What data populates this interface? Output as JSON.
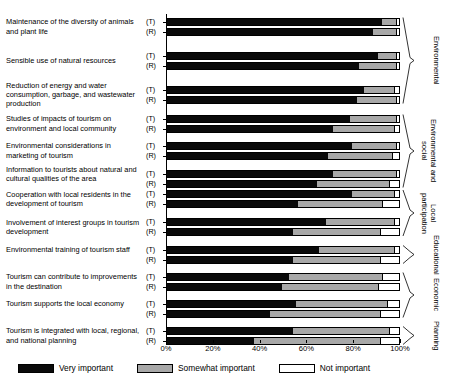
{
  "chart_data": {
    "type": "bar",
    "subtype": "stacked-horizontal-100pct",
    "title": "",
    "xlabel": "",
    "ylabel": "",
    "xlim": [
      0,
      100
    ],
    "xticks": [
      "0%",
      "20%",
      "40%",
      "60%",
      "80%",
      "100%"
    ],
    "xtick_values": [
      0,
      20,
      40,
      60,
      80,
      100
    ],
    "grid": false,
    "legend_position": "bottom-left",
    "series": [
      {
        "name": "Very important",
        "color": "#0a0a0a"
      },
      {
        "name": "Somewhat important",
        "color": "#a8a8a8"
      },
      {
        "name": "Not important",
        "color": "#ffffff"
      }
    ],
    "subgroup_labels": [
      "(T)",
      "(R)"
    ],
    "categories": [
      {
        "label": "Maintenance of the diversity of animals and plant life",
        "rows": [
          {
            "key": "(T)",
            "values": [
              92,
              6,
              2
            ]
          },
          {
            "key": "(R)",
            "values": [
              88,
              10,
              2
            ]
          }
        ]
      },
      {
        "label": "Sensible use of natural resources",
        "rows": [
          {
            "key": "(T)",
            "values": [
              90,
              8,
              2
            ]
          },
          {
            "key": "(R)",
            "values": [
              82,
              16,
              2
            ]
          }
        ]
      },
      {
        "label": "Reduction of energy and water consumption, garbage, and wastewater production",
        "rows": [
          {
            "key": "(T)",
            "values": [
              84,
              13,
              3
            ]
          },
          {
            "key": "(R)",
            "values": [
              81,
              17,
              2
            ]
          }
        ]
      },
      {
        "label": "Studies of impacts of tourism on environment and local community",
        "rows": [
          {
            "key": "(T)",
            "values": [
              78,
              20,
              2
            ]
          },
          {
            "key": "(R)",
            "values": [
              71,
              26,
              3
            ]
          }
        ]
      },
      {
        "label": "Environmental considerations in marketing of tourism",
        "rows": [
          {
            "key": "(T)",
            "values": [
              79,
              19,
              2
            ]
          },
          {
            "key": "(R)",
            "values": [
              69,
              27,
              4
            ]
          }
        ]
      },
      {
        "label": "Information to tourists about natural and cultural qualities of the area",
        "rows": [
          {
            "key": "(T)",
            "values": [
              71,
              27,
              2
            ]
          },
          {
            "key": "(R)",
            "values": [
              64,
              31,
              5
            ]
          }
        ]
      },
      {
        "label": "Cooperation with local residents in the development of tourism",
        "rows": [
          {
            "key": "(T)",
            "values": [
              79,
              18,
              3
            ]
          },
          {
            "key": "(R)",
            "values": [
              56,
              36,
              8
            ]
          }
        ]
      },
      {
        "label": "Involvement of interest groups in tourism development",
        "rows": [
          {
            "key": "(T)",
            "values": [
              68,
              29,
              3
            ]
          },
          {
            "key": "(R)",
            "values": [
              54,
              37,
              9
            ]
          }
        ]
      },
      {
        "label": "Environmental training of tourism staff",
        "rows": [
          {
            "key": "(T)",
            "values": [
              65,
              32,
              3
            ]
          },
          {
            "key": "(R)",
            "values": [
              54,
              37,
              9
            ]
          }
        ]
      },
      {
        "label": "Tourism can contribute to improvements in the destination",
        "rows": [
          {
            "key": "(T)",
            "values": [
              52,
              40,
              8
            ]
          },
          {
            "key": "(R)",
            "values": [
              49,
              41,
              10
            ]
          }
        ]
      },
      {
        "label": "Tourism supports the local economy",
        "rows": [
          {
            "key": "(T)",
            "values": [
              55,
              39,
              6
            ]
          },
          {
            "key": "(R)",
            "values": [
              44,
              47,
              9
            ]
          }
        ]
      },
      {
        "label": "Tourism is integrated with local, regional, and national planning",
        "rows": [
          {
            "key": "(T)",
            "values": [
              54,
              41,
              5
            ]
          },
          {
            "key": "(R)",
            "values": [
              37,
              54,
              9
            ]
          }
        ]
      }
    ],
    "groups": [
      {
        "label": "Environmental",
        "from_category": 0,
        "to_category": 2
      },
      {
        "label": "Environmental and social",
        "from_category": 3,
        "to_category": 5
      },
      {
        "label": "Local participation",
        "from_category": 6,
        "to_category": 7
      },
      {
        "label": "Educational",
        "from_category": 8,
        "to_category": 8
      },
      {
        "label": "Economic",
        "from_category": 9,
        "to_category": 10
      },
      {
        "label": "Planning",
        "from_category": 11,
        "to_category": 11
      }
    ]
  },
  "legend": {
    "items": [
      {
        "label": "Very important",
        "swatch": "very"
      },
      {
        "label": "Somewhat important",
        "swatch": "somewhat"
      },
      {
        "label": "Not important",
        "swatch": "not"
      }
    ]
  }
}
